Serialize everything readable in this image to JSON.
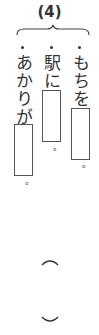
{
  "question_number": "(4)",
  "items": [
    {
      "position": "right",
      "text": "もちを",
      "period": "。"
    },
    {
      "position": "middle",
      "text": "駅に",
      "period": "。"
    },
    {
      "position": "left",
      "text": "あかりが",
      "period": "。"
    }
  ],
  "answer_parentheses": {
    "open": "︵",
    "close": "︶"
  }
}
